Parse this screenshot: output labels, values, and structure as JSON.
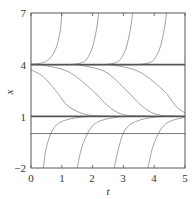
{
  "chart_data": {
    "type": "line",
    "title": "",
    "xlabel": "t",
    "ylabel": "x",
    "xlim": [
      0,
      5
    ],
    "ylim": [
      -2,
      7
    ],
    "xticks": [
      "0",
      "1",
      "2",
      "3",
      "4",
      "5"
    ],
    "yticks": [
      "−2",
      "1",
      "4",
      "7"
    ],
    "grid": false,
    "legend": null,
    "equilibria": [
      {
        "name": "x=4",
        "y": 4,
        "style": "thick"
      },
      {
        "name": "x=1",
        "y": 1,
        "style": "thick"
      },
      {
        "name": "x=0",
        "y": 0,
        "style": "thin"
      }
    ],
    "series": [
      {
        "name": "upper-1",
        "group": "diverging above 4",
        "points": [
          [
            0,
            4.02
          ],
          [
            0.5,
            4.2
          ],
          [
            0.8,
            4.9
          ],
          [
            0.95,
            6.0
          ],
          [
            1.0,
            7
          ]
        ]
      },
      {
        "name": "upper-2",
        "group": "diverging above 4",
        "points": [
          [
            0,
            4.0
          ],
          [
            1.5,
            4.05
          ],
          [
            1.9,
            4.6
          ],
          [
            2.1,
            5.8
          ],
          [
            2.2,
            7
          ]
        ]
      },
      {
        "name": "upper-3",
        "group": "diverging above 4",
        "points": [
          [
            1.2,
            4.0
          ],
          [
            2.6,
            4.05
          ],
          [
            3.0,
            4.6
          ],
          [
            3.2,
            5.8
          ],
          [
            3.3,
            7
          ]
        ]
      },
      {
        "name": "upper-4",
        "group": "diverging above 4",
        "points": [
          [
            2.3,
            4.0
          ],
          [
            3.7,
            4.05
          ],
          [
            4.1,
            4.6
          ],
          [
            4.3,
            5.8
          ],
          [
            4.4,
            7
          ]
        ]
      },
      {
        "name": "middle-1",
        "group": "from 4 to 1",
        "points": [
          [
            0,
            3.7
          ],
          [
            0.4,
            3.3
          ],
          [
            0.8,
            2.5
          ],
          [
            1.2,
            1.6
          ],
          [
            1.8,
            1.1
          ],
          [
            2.6,
            1.0
          ]
        ]
      },
      {
        "name": "middle-2",
        "group": "from 4 to 1",
        "points": [
          [
            0.3,
            4.0
          ],
          [
            1.2,
            3.6
          ],
          [
            2.0,
            2.5
          ],
          [
            2.5,
            1.6
          ],
          [
            3.0,
            1.1
          ],
          [
            3.8,
            1.0
          ]
        ]
      },
      {
        "name": "middle-3",
        "group": "from 4 to 1",
        "points": [
          [
            1.5,
            4.0
          ],
          [
            2.4,
            3.6
          ],
          [
            3.1,
            2.5
          ],
          [
            3.6,
            1.6
          ],
          [
            4.1,
            1.1
          ],
          [
            4.9,
            1.0
          ]
        ]
      },
      {
        "name": "middle-4",
        "group": "from 4 to 1",
        "points": [
          [
            2.6,
            4.0
          ],
          [
            3.5,
            3.6
          ],
          [
            4.3,
            2.5
          ],
          [
            4.7,
            1.6
          ],
          [
            5.0,
            1.2
          ]
        ]
      },
      {
        "name": "lower-1",
        "group": "from -2 to 1",
        "points": [
          [
            0.4,
            -2
          ],
          [
            0.5,
            -0.8
          ],
          [
            0.7,
            0.2
          ],
          [
            1.0,
            0.7
          ],
          [
            1.6,
            0.95
          ],
          [
            2.3,
            1.0
          ]
        ]
      },
      {
        "name": "lower-2",
        "group": "from -2 to 1",
        "points": [
          [
            1.5,
            -2
          ],
          [
            1.65,
            -0.8
          ],
          [
            1.9,
            0.2
          ],
          [
            2.2,
            0.7
          ],
          [
            2.8,
            0.95
          ],
          [
            3.5,
            1.0
          ]
        ]
      },
      {
        "name": "lower-3",
        "group": "from -2 to 1",
        "points": [
          [
            2.7,
            -2
          ],
          [
            2.85,
            -0.8
          ],
          [
            3.05,
            0.2
          ],
          [
            3.4,
            0.7
          ],
          [
            4.0,
            0.95
          ],
          [
            4.7,
            1.0
          ]
        ]
      },
      {
        "name": "lower-4",
        "group": "from -2 to 1",
        "points": [
          [
            3.8,
            -2
          ],
          [
            3.95,
            -0.8
          ],
          [
            4.2,
            0.2
          ],
          [
            4.5,
            0.7
          ],
          [
            5.0,
            0.95
          ]
        ]
      }
    ]
  },
  "colors": {
    "curve": "#8a8a8a",
    "equilibrium": "#555555",
    "axis": "#555555",
    "text": "#333333"
  }
}
